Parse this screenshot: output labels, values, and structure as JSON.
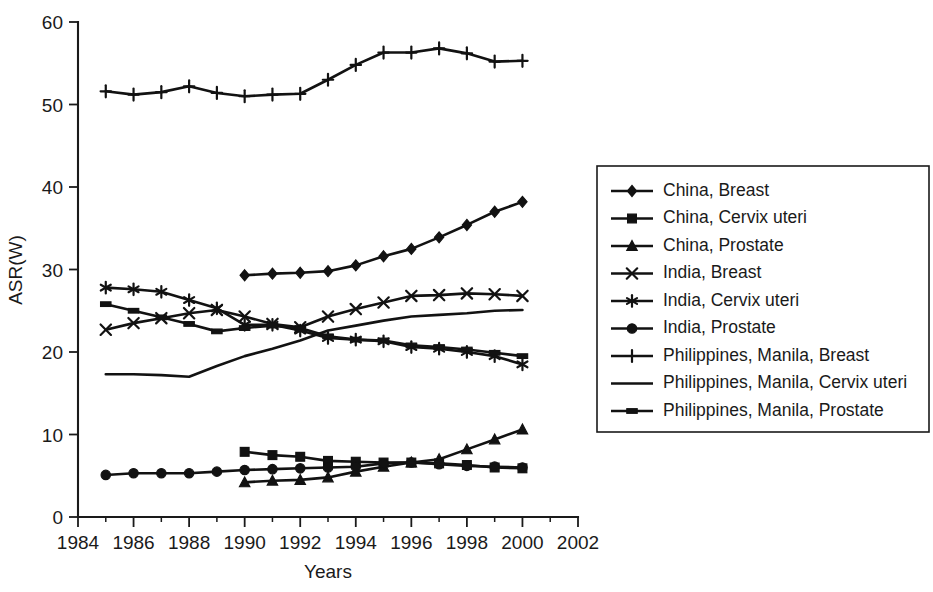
{
  "chart_data": {
    "type": "line",
    "title": "",
    "xlabel": "Years",
    "ylabel": "ASR(W)",
    "xlim": [
      1984,
      2002
    ],
    "ylim": [
      0,
      60
    ],
    "xticks": [
      1984,
      1986,
      1988,
      1990,
      1992,
      1994,
      1996,
      1998,
      2000,
      2002
    ],
    "xtick_labels": [
      "1984",
      "1986",
      "1988",
      "1990",
      "1992",
      "1994",
      "1996",
      "1998",
      "2000",
      "2002"
    ],
    "yticks": [
      0,
      10,
      20,
      30,
      40,
      50,
      60
    ],
    "ytick_labels": [
      "0",
      "10",
      "20",
      "30",
      "40",
      "50",
      "60"
    ],
    "x_minor_tick_step": 1,
    "grid": false,
    "legend_position": "right",
    "series": [
      {
        "name": "China, Breast",
        "marker": "diamond",
        "x": [
          1990,
          1991,
          1992,
          1993,
          1994,
          1995,
          1996,
          1997,
          1998,
          1999,
          2000
        ],
        "values": [
          29.3,
          29.5,
          29.6,
          29.8,
          30.5,
          31.6,
          32.5,
          33.9,
          35.4,
          37.0,
          38.2
        ]
      },
      {
        "name": "China, Cervix uteri",
        "marker": "square",
        "x": [
          1990,
          1991,
          1992,
          1993,
          1994,
          1995,
          1996,
          1997,
          1998,
          1999,
          2000
        ],
        "values": [
          7.9,
          7.5,
          7.3,
          6.8,
          6.7,
          6.6,
          6.6,
          6.5,
          6.3,
          6.0,
          5.9
        ]
      },
      {
        "name": "China, Prostate",
        "marker": "triangle",
        "x": [
          1990,
          1991,
          1992,
          1993,
          1994,
          1995,
          1996,
          1997,
          1998,
          1999,
          2000
        ],
        "values": [
          4.2,
          4.4,
          4.5,
          4.8,
          5.5,
          6.1,
          6.6,
          7.0,
          8.2,
          9.4,
          10.6
        ]
      },
      {
        "name": "India, Breast",
        "marker": "cross",
        "x": [
          1985,
          1986,
          1987,
          1988,
          1989,
          1990,
          1991,
          1992,
          1993,
          1994,
          1995,
          1996,
          1997,
          1998,
          1999,
          2000
        ],
        "values": [
          22.7,
          23.5,
          24.1,
          24.7,
          25.1,
          24.3,
          23.4,
          23.0,
          24.3,
          25.2,
          26.0,
          26.8,
          26.9,
          27.1,
          27.0,
          26.8
        ]
      },
      {
        "name": "India, Cervix uteri",
        "marker": "asterisk",
        "x": [
          1985,
          1986,
          1987,
          1988,
          1989,
          1990,
          1991,
          1992,
          1993,
          1994,
          1995,
          1996,
          1997,
          1998,
          1999,
          2000
        ],
        "values": [
          27.8,
          27.6,
          27.3,
          26.3,
          25.3,
          23.3,
          23.3,
          22.6,
          21.7,
          21.5,
          21.3,
          20.6,
          20.4,
          20.0,
          19.5,
          18.5
        ]
      },
      {
        "name": "India, Prostate",
        "marker": "circle",
        "x": [
          1985,
          1986,
          1987,
          1988,
          1989,
          1990,
          1991,
          1992,
          1993,
          1994,
          1995,
          1996,
          1997,
          1998,
          1999,
          2000
        ],
        "values": [
          5.1,
          5.3,
          5.3,
          5.3,
          5.5,
          5.7,
          5.8,
          5.9,
          6.0,
          6.1,
          6.5,
          6.6,
          6.4,
          6.2,
          6.1,
          6.0
        ]
      },
      {
        "name": "Philippines, Manila, Breast",
        "marker": "plus",
        "x": [
          1985,
          1986,
          1987,
          1988,
          1989,
          1990,
          1991,
          1992,
          1993,
          1994,
          1995,
          1996,
          1997,
          1998,
          1999,
          2000
        ],
        "values": [
          51.6,
          51.2,
          51.5,
          52.2,
          51.4,
          51.0,
          51.2,
          51.3,
          53.0,
          54.8,
          56.3,
          56.3,
          56.8,
          56.2,
          55.2,
          55.3
        ]
      },
      {
        "name": "Philippines, Manila, Cervix uteri",
        "marker": "none",
        "x": [
          1985,
          1986,
          1987,
          1988,
          1989,
          1990,
          1991,
          1992,
          1993,
          1994,
          1995,
          1996,
          1997,
          1998,
          1999,
          2000
        ],
        "values": [
          17.3,
          17.3,
          17.2,
          17.0,
          18.3,
          19.5,
          20.4,
          21.4,
          22.6,
          23.2,
          23.8,
          24.3,
          24.5,
          24.7,
          25.0,
          25.1
        ]
      },
      {
        "name": "Philippines, Manila, Prostate",
        "marker": "dash",
        "x": [
          1985,
          1986,
          1987,
          1988,
          1989,
          1990,
          1991,
          1992,
          1993,
          1994,
          1995,
          1996,
          1997,
          1998,
          1999,
          2000
        ],
        "values": [
          25.8,
          25.0,
          24.2,
          23.4,
          22.5,
          22.9,
          23.2,
          22.9,
          21.9,
          21.5,
          21.4,
          20.8,
          20.6,
          20.3,
          19.9,
          19.5
        ]
      }
    ]
  },
  "legend": {
    "entries": [
      {
        "label": "China, Breast"
      },
      {
        "label": "China, Cervix uteri"
      },
      {
        "label": "China, Prostate"
      },
      {
        "label": "India, Breast"
      },
      {
        "label": "India, Cervix uteri"
      },
      {
        "label": "India, Prostate"
      },
      {
        "label": "Philippines, Manila, Breast"
      },
      {
        "label": "Philippines, Manila, Cervix uteri"
      },
      {
        "label": "Philippines, Manila, Prostate"
      }
    ]
  },
  "colors": {
    "ink": "#121212",
    "background": "#ffffff"
  }
}
